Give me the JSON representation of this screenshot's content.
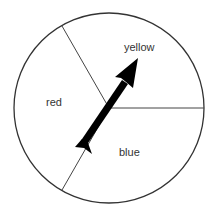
{
  "diagram": {
    "type": "spinner",
    "sections": [
      {
        "id": "yellow",
        "label": "yellow"
      },
      {
        "id": "red",
        "label": "red"
      },
      {
        "id": "blue",
        "label": "blue"
      }
    ],
    "arrow": {
      "points_to": "yellow"
    }
  },
  "colors": {
    "outline": "#333333",
    "arrow": "#000000",
    "background": "#ffffff"
  }
}
